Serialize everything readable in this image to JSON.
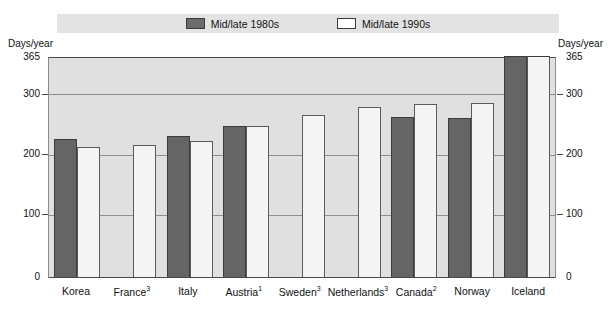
{
  "legend": {
    "items": [
      {
        "label": "Mid/late 1980s",
        "swatch": "dark",
        "color": "#6b6b6b"
      },
      {
        "label": "Mid/late 1990s",
        "swatch": "light",
        "color": "#ffffff"
      }
    ]
  },
  "axis": {
    "left_caption": "Days/year",
    "right_caption": "Days/year",
    "ticks": [
      "365",
      "300",
      "200",
      "100",
      "0"
    ]
  },
  "chart_data": {
    "type": "bar",
    "title": "",
    "xlabel": "",
    "ylabel": "Days/year",
    "ylim": [
      0,
      365
    ],
    "yticks": [
      0,
      100,
      200,
      300,
      365
    ],
    "grid": true,
    "legend_position": "top",
    "categories": [
      "Korea",
      "France",
      "Italy",
      "Austria",
      "Sweden",
      "Netherlands",
      "Canada",
      "Norway",
      "Iceland"
    ],
    "category_labels": [
      "Korea",
      "France³",
      "Italy",
      "Austria¹",
      "Sweden³",
      "Netherlands³",
      "Canada²",
      "Norway",
      "Iceland"
    ],
    "footnotes": [
      "1",
      "2",
      "3"
    ],
    "series": [
      {
        "name": "Mid/late 1980s",
        "color": "#6b6b6b",
        "values": [
          228,
          null,
          233,
          249,
          null,
          null,
          265,
          262,
          365
        ]
      },
      {
        "name": "Mid/late 1990s",
        "color": "#f4f4f4",
        "values": [
          214,
          218,
          224,
          250,
          268,
          280,
          285,
          288,
          365
        ]
      }
    ]
  }
}
